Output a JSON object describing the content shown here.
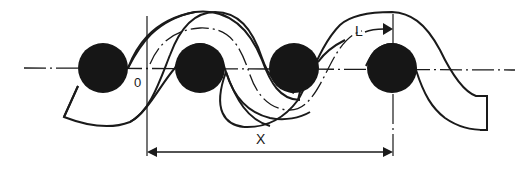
{
  "diagram": {
    "type": "woven yarn crimp schematic",
    "labels": {
      "origin": "0",
      "length": "L",
      "span": "X"
    },
    "colors": {
      "stroke": "#1a1a1a",
      "fill_circles": "#161616",
      "background": "#ffffff"
    },
    "circles": [
      {
        "cx": 103,
        "cy": 68,
        "r": 25
      },
      {
        "cx": 200,
        "cy": 68,
        "r": 25
      },
      {
        "cx": 294,
        "cy": 68,
        "r": 25
      },
      {
        "cx": 392,
        "cy": 68,
        "r": 25
      }
    ]
  }
}
